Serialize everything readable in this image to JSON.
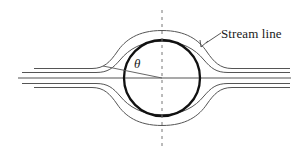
{
  "figure": {
    "type": "diagram",
    "background_color": "#ffffff",
    "width": 301,
    "height": 157
  },
  "labels": {
    "stream_line": "Stream line",
    "theta": "θ"
  },
  "colors": {
    "cylinder_stroke": "#111111",
    "streamline_stroke": "#555555",
    "axis_stroke": "#555555",
    "dashed_stroke": "#777777",
    "leader_stroke": "#444444",
    "text": "#1a1a1a"
  },
  "geometry": {
    "cylinder": {
      "center_x": 162,
      "center_y": 78,
      "radius": 38,
      "stroke_width": 2.2
    },
    "symmetry_axis": {
      "x": 162,
      "y_top": 10,
      "y_bottom": 150,
      "dash": "3 4",
      "stroke_width": 1
    },
    "centerline": {
      "y": 78,
      "x_start": 18,
      "x_end": 291,
      "stroke_width": 1.1
    },
    "radius_line": {
      "from_x": 162,
      "from_y": 78,
      "to_x": 103,
      "to_y": 66,
      "angle_degrees": 11.5
    },
    "leader_line": {
      "from_x": 203,
      "from_y": 46,
      "to_x": 221,
      "to_y": 33
    },
    "label_positions": {
      "stream_line_x": 221,
      "stream_line_y": 26,
      "theta_x": 134,
      "theta_y": 56
    },
    "streamlines": [
      {
        "name": "upper-outer",
        "side": "upper",
        "inlet_y": 69,
        "crest_y": 30
      },
      {
        "name": "upper-inner",
        "side": "upper",
        "inlet_y": 72,
        "crest_y": 41
      },
      {
        "name": "lower-inner",
        "side": "lower",
        "inlet_y": 84,
        "crest_y": 115
      },
      {
        "name": "lower-outer",
        "side": "lower",
        "inlet_y": 87,
        "crest_y": 125
      }
    ]
  }
}
